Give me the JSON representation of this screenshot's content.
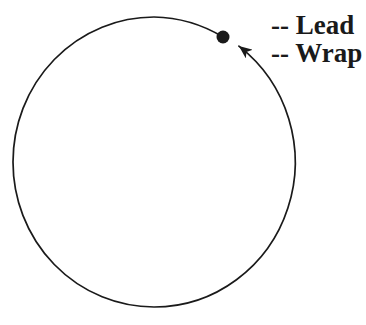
{
  "figure": {
    "background_color": "#ffffff",
    "line_color": "#1a1a1a",
    "labels": [
      {
        "text": "-- Lead"
      },
      {
        "text": "-- Wrap"
      }
    ]
  }
}
